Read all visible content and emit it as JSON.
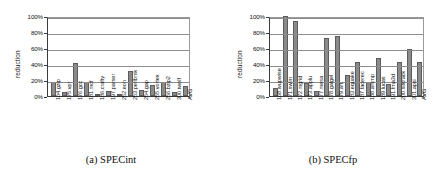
{
  "figure": {
    "panels": [
      {
        "caption": "(a) SPECint",
        "ylabel": "reduction",
        "chart_data": {
          "type": "bar",
          "title": "",
          "xlabel": "",
          "ylabel": "reduction",
          "ylim": [
            0,
            100
          ],
          "yticks": [
            "0%",
            "20%",
            "40%",
            "60%",
            "80%",
            "100%"
          ],
          "ytick_values": [
            0,
            20,
            40,
            60,
            80,
            100
          ],
          "grid": true,
          "legend": "none",
          "categories": [
            "164.gzip",
            "175.vpr",
            "176.gcc",
            "181.mcf",
            "186.crafty",
            "197.parser",
            "252.eon",
            "253.perlbmk",
            "254.gap",
            "255.vortex",
            "256.bzip2",
            "300.twolf",
            "AVG"
          ],
          "values": [
            18,
            5,
            41,
            17,
            1,
            6,
            1,
            31,
            7,
            14,
            18,
            5,
            12
          ]
        }
      },
      {
        "caption": "(b) SPECfp",
        "ylabel": "reduction",
        "chart_data": {
          "type": "bar",
          "title": "",
          "xlabel": "",
          "ylabel": "reduction",
          "ylim": [
            0,
            100
          ],
          "yticks": [
            "0%",
            "20%",
            "40%",
            "60%",
            "80%",
            "100%"
          ],
          "ytick_values": [
            0,
            20,
            40,
            60,
            80,
            100
          ],
          "grid": true,
          "legend": "none",
          "categories": [
            "168.wupwise",
            "171.swim",
            "172.mgrid",
            "173.applu",
            "177.mesa",
            "178.galgel",
            "179.art",
            "183.equake",
            "187.facerec",
            "188.ammp",
            "189.lucas",
            "191.fma3d",
            "200.sixtrack",
            "301.apsi",
            "AVG"
          ],
          "values": [
            10,
            100,
            94,
            16,
            6,
            72,
            75,
            26,
            43,
            18,
            47,
            15,
            42,
            59,
            43
          ]
        }
      }
    ]
  },
  "colors": {
    "bar_fill": "#8a8a8a",
    "bar_stroke": "#5c5c5c",
    "gridline": "#8d8d8d",
    "axis": "#3a3a3a"
  }
}
